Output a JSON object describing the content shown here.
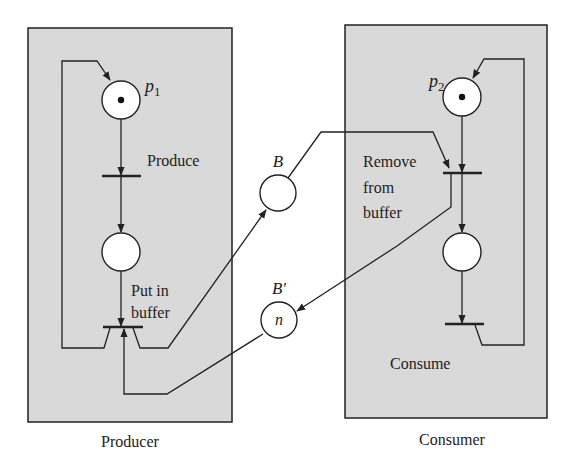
{
  "diagram": {
    "type": "petri-net",
    "colors": {
      "box_fill": "#d9d9d9",
      "stroke": "#222222",
      "place_fill": "#ffffff"
    },
    "producer": {
      "caption": "Producer",
      "place_p1": {
        "label": "p",
        "subscript": "1",
        "tokens": 1
      },
      "transition_produce": {
        "label": "Produce"
      },
      "place_middle": {
        "tokens": 0
      },
      "transition_put": {
        "label_line1": "Put in",
        "label_line2": "buffer"
      }
    },
    "consumer": {
      "caption": "Consumer",
      "place_p2": {
        "label": "p",
        "subscript": "2",
        "tokens": 1
      },
      "transition_remove": {
        "label_line1": "Remove",
        "label_line2": "from",
        "label_line3": "buffer"
      },
      "place_middle": {
        "tokens": 0
      },
      "transition_consume": {
        "label": "Consume"
      }
    },
    "buffer": {
      "place_B": {
        "label": "B",
        "content": ""
      },
      "place_Bprime": {
        "label": "B′",
        "content": "n"
      }
    }
  }
}
